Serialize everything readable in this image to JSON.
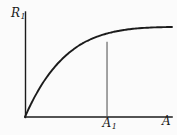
{
  "figure": {
    "name": "r1-vs-a-saturating-curve",
    "background_color": "#fbfbfb",
    "line_color": "#1b1b1b"
  },
  "labels": {
    "y_axis": "R",
    "y_axis_sub": "1",
    "x_axis": "A",
    "marker": "A",
    "marker_sub": "1"
  },
  "chart_data": {
    "type": "line",
    "title": "",
    "xlabel": "A",
    "ylabel": "R1",
    "grid": false,
    "legend": null,
    "xlim": [
      0,
      1
    ],
    "ylim": [
      0,
      1
    ],
    "annotations": [
      {
        "label": "A1",
        "type": "vertical-dropline",
        "x": 0.558,
        "y_from": 0,
        "y_to": 0.963
      }
    ],
    "series": [
      {
        "name": "R1(A)",
        "x": [
          0.0,
          0.02,
          0.041,
          0.061,
          0.082,
          0.102,
          0.122,
          0.143,
          0.163,
          0.184,
          0.204,
          0.224,
          0.245,
          0.265,
          0.286,
          0.306,
          0.327,
          0.347,
          0.367,
          0.388,
          0.408,
          0.429,
          0.449,
          0.469,
          0.49,
          0.51,
          0.531,
          0.551,
          0.558,
          0.571,
          0.592,
          0.612,
          0.633,
          0.653,
          0.673,
          0.694,
          0.714,
          0.735,
          0.755,
          0.776,
          0.796,
          0.816,
          0.837,
          0.857,
          0.878,
          0.898,
          0.918,
          0.939,
          0.959,
          0.98,
          1.0
        ],
        "y": [
          0.0,
          0.086,
          0.167,
          0.242,
          0.312,
          0.378,
          0.439,
          0.496,
          0.549,
          0.599,
          0.645,
          0.688,
          0.728,
          0.765,
          0.8,
          0.832,
          0.862,
          0.889,
          0.915,
          0.938,
          0.96,
          0.979,
          0.997,
          1.014,
          1.029,
          1.042,
          1.055,
          1.066,
          1.069,
          1.076,
          1.085,
          1.094,
          1.101,
          1.108,
          1.114,
          1.12,
          1.124,
          1.129,
          1.132,
          1.136,
          1.139,
          1.141,
          1.143,
          1.145,
          1.147,
          1.148,
          1.149,
          1.15,
          1.151,
          1.152,
          1.152
        ]
      }
    ],
    "axes": {
      "origin_px": [
        25,
        117
      ],
      "x_axis_end_px": [
        172,
        117
      ],
      "y_axis_top_px": [
        25,
        12
      ],
      "plateau_y_px": 27
    }
  }
}
